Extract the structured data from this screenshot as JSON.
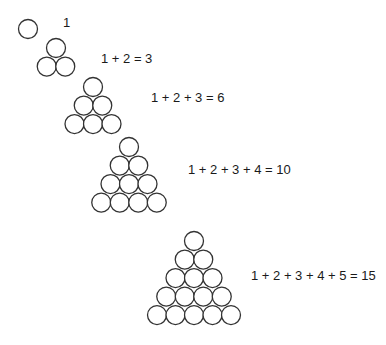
{
  "diagram": {
    "stroke_color": "#333333",
    "circle_radius": 9.5,
    "rows": [
      {
        "n": 1,
        "label": "1",
        "apex": [
          28,
          29
        ],
        "label_pos": [
          63,
          15
        ]
      },
      {
        "n": 2,
        "label": "1 + 2 = 3",
        "apex": [
          56,
          48
        ],
        "label_pos": [
          101,
          51
        ]
      },
      {
        "n": 3,
        "label": "1 + 2 + 3 = 6",
        "apex": [
          93,
          87
        ],
        "label_pos": [
          151,
          90
        ]
      },
      {
        "n": 4,
        "label": "1 + 2 + 3 + 4 = 10",
        "apex": [
          129,
          147
        ],
        "label_pos": [
          188,
          162
        ]
      },
      {
        "n": 5,
        "label": "1 + 2 + 3 + 4 + 5 = 15",
        "apex": [
          194,
          241
        ],
        "label_pos": [
          251,
          268
        ]
      }
    ]
  }
}
